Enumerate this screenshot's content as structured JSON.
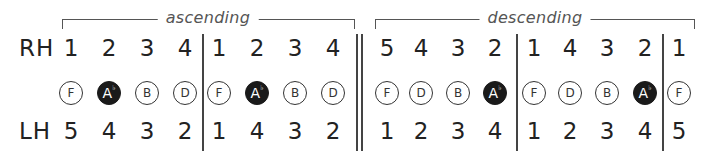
{
  "brackets": {
    "ascending": "ascending",
    "descending": "descending"
  },
  "hands": {
    "rh_label": "RH",
    "lh_label": "LH"
  },
  "columns": [
    {
      "rh": "1",
      "note": "F",
      "flat": "",
      "filled": false,
      "lh": "5",
      "x": 71
    },
    {
      "rh": "2",
      "note": "A",
      "flat": "♭",
      "filled": true,
      "lh": "4",
      "x": 109
    },
    {
      "rh": "3",
      "note": "B",
      "flat": "",
      "filled": false,
      "lh": "3",
      "x": 147
    },
    {
      "rh": "4",
      "note": "D",
      "flat": "",
      "filled": false,
      "lh": "2",
      "x": 185
    },
    {
      "rh": "1",
      "note": "F",
      "flat": "",
      "filled": false,
      "lh": "1",
      "x": 219
    },
    {
      "rh": "2",
      "note": "A",
      "flat": "♭",
      "filled": true,
      "lh": "4",
      "x": 257
    },
    {
      "rh": "3",
      "note": "B",
      "flat": "",
      "filled": false,
      "lh": "3",
      "x": 295
    },
    {
      "rh": "4",
      "note": "D",
      "flat": "",
      "filled": false,
      "lh": "2",
      "x": 333
    },
    {
      "rh": "5",
      "note": "F",
      "flat": "",
      "filled": false,
      "lh": "1",
      "x": 387
    },
    {
      "rh": "4",
      "note": "D",
      "flat": "",
      "filled": false,
      "lh": "2",
      "x": 421
    },
    {
      "rh": "3",
      "note": "B",
      "flat": "",
      "filled": false,
      "lh": "3",
      "x": 458
    },
    {
      "rh": "2",
      "note": "A",
      "flat": "♭",
      "filled": true,
      "lh": "4",
      "x": 495
    },
    {
      "rh": "1",
      "note": "F",
      "flat": "",
      "filled": false,
      "lh": "1",
      "x": 534
    },
    {
      "rh": "4",
      "note": "D",
      "flat": "",
      "filled": false,
      "lh": "2",
      "x": 570
    },
    {
      "rh": "3",
      "note": "B",
      "flat": "",
      "filled": false,
      "lh": "3",
      "x": 607
    },
    {
      "rh": "2",
      "note": "A",
      "flat": "♭",
      "filled": true,
      "lh": "4",
      "x": 645
    },
    {
      "rh": "1",
      "note": "F",
      "flat": "",
      "filled": false,
      "lh": "5",
      "x": 679
    }
  ],
  "colors": {
    "ink": "#222222",
    "filled_note": "#1a1a1a",
    "bracket": "#555555"
  }
}
